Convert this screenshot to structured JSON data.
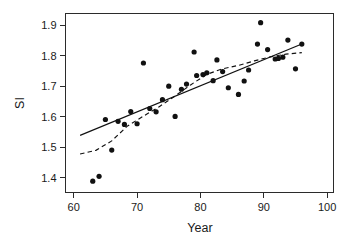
{
  "chart_data": {
    "type": "scatter",
    "title": "",
    "xlabel": "Year",
    "ylabel": "SI",
    "xlim": [
      58.7,
      101.0
    ],
    "ylim": [
      1.352,
      1.938
    ],
    "xticks": [
      60,
      70,
      80,
      90,
      100
    ],
    "yticks": [
      1.4,
      1.5,
      1.6,
      1.7,
      1.8,
      1.9
    ],
    "xtick_labels": [
      "60",
      "70",
      "80",
      "90",
      "100"
    ],
    "ytick_labels": [
      "1.4",
      "1.5",
      "1.6",
      "1.7",
      "1.8",
      "1.9"
    ],
    "grid": false,
    "legend": "none",
    "marker": "filled-circle",
    "points": [
      {
        "x": 63.0,
        "y": 1.389
      },
      {
        "x": 64.0,
        "y": 1.405
      },
      {
        "x": 65.0,
        "y": 1.591
      },
      {
        "x": 66.0,
        "y": 1.491
      },
      {
        "x": 67.0,
        "y": 1.585
      },
      {
        "x": 68.0,
        "y": 1.575
      },
      {
        "x": 69.0,
        "y": 1.617
      },
      {
        "x": 70.0,
        "y": 1.577
      },
      {
        "x": 71.0,
        "y": 1.776
      },
      {
        "x": 72.0,
        "y": 1.627
      },
      {
        "x": 73.0,
        "y": 1.616
      },
      {
        "x": 74.0,
        "y": 1.656
      },
      {
        "x": 75.0,
        "y": 1.7
      },
      {
        "x": 76.0,
        "y": 1.601
      },
      {
        "x": 77.0,
        "y": 1.69
      },
      {
        "x": 77.8,
        "y": 1.707
      },
      {
        "x": 79.0,
        "y": 1.812
      },
      {
        "x": 79.4,
        "y": 1.735
      },
      {
        "x": 80.4,
        "y": 1.738
      },
      {
        "x": 81.0,
        "y": 1.744
      },
      {
        "x": 82.0,
        "y": 1.718
      },
      {
        "x": 82.6,
        "y": 1.786
      },
      {
        "x": 83.5,
        "y": 1.748
      },
      {
        "x": 84.4,
        "y": 1.695
      },
      {
        "x": 86.0,
        "y": 1.673
      },
      {
        "x": 86.9,
        "y": 1.717
      },
      {
        "x": 87.6,
        "y": 1.753
      },
      {
        "x": 89.0,
        "y": 1.838
      },
      {
        "x": 89.5,
        "y": 1.908
      },
      {
        "x": 90.6,
        "y": 1.82
      },
      {
        "x": 91.8,
        "y": 1.789
      },
      {
        "x": 92.3,
        "y": 1.791
      },
      {
        "x": 93.0,
        "y": 1.795
      },
      {
        "x": 93.8,
        "y": 1.851
      },
      {
        "x": 95.0,
        "y": 1.757
      },
      {
        "x": 96.0,
        "y": 1.838
      }
    ],
    "series": [
      {
        "name": "linear-fit",
        "style": "solid",
        "points": [
          {
            "x": 61.0,
            "y": 1.539
          },
          {
            "x": 96.0,
            "y": 1.838
          }
        ]
      },
      {
        "name": "lowess-smoother",
        "style": "dashed",
        "points": [
          {
            "x": 61.0,
            "y": 1.478
          },
          {
            "x": 63.5,
            "y": 1.49
          },
          {
            "x": 66.0,
            "y": 1.521
          },
          {
            "x": 68.5,
            "y": 1.57
          },
          {
            "x": 71.0,
            "y": 1.602
          },
          {
            "x": 73.5,
            "y": 1.633
          },
          {
            "x": 76.0,
            "y": 1.668
          },
          {
            "x": 78.5,
            "y": 1.705
          },
          {
            "x": 81.0,
            "y": 1.739
          },
          {
            "x": 83.5,
            "y": 1.757
          },
          {
            "x": 86.0,
            "y": 1.768
          },
          {
            "x": 88.5,
            "y": 1.783
          },
          {
            "x": 91.0,
            "y": 1.796
          },
          {
            "x": 93.5,
            "y": 1.805
          },
          {
            "x": 96.0,
            "y": 1.81
          }
        ]
      }
    ]
  }
}
